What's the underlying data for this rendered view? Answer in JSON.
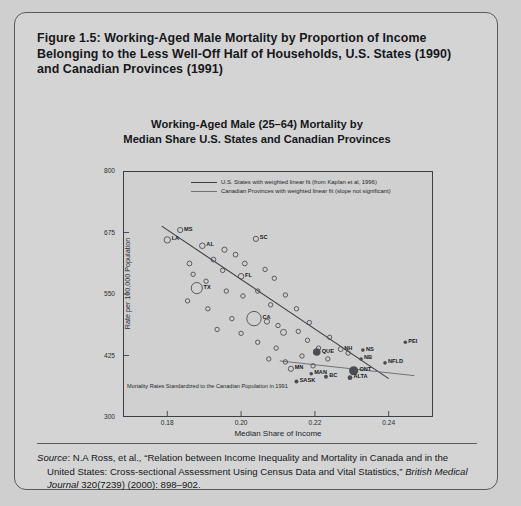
{
  "figure": {
    "caption": "Figure 1.5: Working-Aged Male Mortality by Proportion of Income Belonging to the Less Well-Off Half of Households, U.S. States (1990) and Canadian Provinces (1991)"
  },
  "source": {
    "label": "Source",
    "sep": ": ",
    "part1": "N.A Ross, et al., “Relation between Income Inequality and Mortality in Canada and in the United States: Cross-sectional Assessment Using Census Data and Vital Statistics,” ",
    "journal": "British Medical Journal",
    "part2": " 320(7239) (2000): 898–902."
  },
  "chart_data": {
    "type": "scatter",
    "title": "Working-Aged Male (25–64) Mortality by Median Share U.S. States and Canadian Provinces",
    "title_line1": "Working-Aged Male (25–64) Mortality by",
    "title_line2": "Median Share U.S. States and Canadian Provinces",
    "xlabel": "Median Share of Income",
    "ylabel": "Rate per 100,000 Population",
    "xlim": [
      0.168,
      0.252
    ],
    "ylim": [
      300,
      800
    ],
    "xticks": [
      "0.18",
      "0.20",
      "0.22",
      "0.24"
    ],
    "xtick_values": [
      0.18,
      0.2,
      0.22,
      0.24
    ],
    "yticks": [
      "300",
      "425",
      "550",
      "675",
      "800"
    ],
    "ytick_values": [
      300,
      425,
      550,
      675,
      800
    ],
    "grid": false,
    "note": "Mortality Rates Standardized to the Canadian Population in 1991",
    "legend_position": "top-center-inside",
    "legend": [
      {
        "name": "us-fit",
        "label": "U.S. States with weighted linear fit (from Kaplan et al, 1996)",
        "color": "#3a3d42"
      },
      {
        "name": "canada-fit",
        "label": "Canadian Provinces with weighted linear fit (slope not significant)",
        "color": "#6f7378"
      }
    ],
    "series": [
      {
        "name": "U.S. States",
        "marker": "open-circle",
        "color": "#4a4d52",
        "points": [
          {
            "label": "LA",
            "x": 0.18,
            "y": 660,
            "r": 3.2
          },
          {
            "label": "MS",
            "x": 0.1835,
            "y": 680,
            "r": 2.6
          },
          {
            "label": "AL",
            "x": 0.1895,
            "y": 648,
            "r": 2.8
          },
          {
            "label": "SC",
            "x": 0.204,
            "y": 662,
            "r": 2.6
          },
          {
            "label": "FL",
            "x": 0.2,
            "y": 586,
            "r": 2.8
          },
          {
            "label": "TX",
            "x": 0.188,
            "y": 562,
            "r": 5.6
          },
          {
            "label": "CA",
            "x": 0.2035,
            "y": 500,
            "r": 7.2
          },
          {
            "label": "NH",
            "x": 0.227,
            "y": 438,
            "r": 2.4
          },
          {
            "label": "MN",
            "x": 0.2135,
            "y": 398,
            "r": 2.6
          },
          {
            "label": "",
            "x": 0.186,
            "y": 612,
            "r": 2.4
          },
          {
            "label": "",
            "x": 0.1925,
            "y": 620,
            "r": 2.4
          },
          {
            "label": "",
            "x": 0.1955,
            "y": 640,
            "r": 2.6
          },
          {
            "label": "",
            "x": 0.1985,
            "y": 630,
            "r": 2.4
          },
          {
            "label": "",
            "x": 0.195,
            "y": 598,
            "r": 2.2
          },
          {
            "label": "",
            "x": 0.1905,
            "y": 576,
            "r": 2.2
          },
          {
            "label": "",
            "x": 0.187,
            "y": 590,
            "r": 2.2
          },
          {
            "label": "",
            "x": 0.201,
            "y": 612,
            "r": 2.4
          },
          {
            "label": "",
            "x": 0.2065,
            "y": 600,
            "r": 2.2
          },
          {
            "label": "",
            "x": 0.209,
            "y": 582,
            "r": 2.2
          },
          {
            "label": "",
            "x": 0.196,
            "y": 556,
            "r": 2.2
          },
          {
            "label": "",
            "x": 0.2005,
            "y": 546,
            "r": 2.2
          },
          {
            "label": "",
            "x": 0.2045,
            "y": 556,
            "r": 2.2
          },
          {
            "label": "",
            "x": 0.1855,
            "y": 536,
            "r": 2.2
          },
          {
            "label": "",
            "x": 0.191,
            "y": 520,
            "r": 2.2
          },
          {
            "label": "",
            "x": 0.208,
            "y": 528,
            "r": 2.2
          },
          {
            "label": "",
            "x": 0.212,
            "y": 548,
            "r": 2.2
          },
          {
            "label": "",
            "x": 0.215,
            "y": 520,
            "r": 2.2
          },
          {
            "label": "",
            "x": 0.1975,
            "y": 500,
            "r": 2.2
          },
          {
            "label": "",
            "x": 0.207,
            "y": 494,
            "r": 2.6
          },
          {
            "label": "",
            "x": 0.21,
            "y": 486,
            "r": 2.2
          },
          {
            "label": "",
            "x": 0.2115,
            "y": 472,
            "r": 3.0
          },
          {
            "label": "",
            "x": 0.1935,
            "y": 478,
            "r": 2.2
          },
          {
            "label": "",
            "x": 0.2,
            "y": 470,
            "r": 2.2
          },
          {
            "label": "",
            "x": 0.2155,
            "y": 474,
            "r": 2.2
          },
          {
            "label": "",
            "x": 0.2185,
            "y": 492,
            "r": 2.2
          },
          {
            "label": "",
            "x": 0.218,
            "y": 456,
            "r": 2.2
          },
          {
            "label": "",
            "x": 0.2045,
            "y": 452,
            "r": 2.2
          },
          {
            "label": "",
            "x": 0.2095,
            "y": 440,
            "r": 2.2
          },
          {
            "label": "",
            "x": 0.221,
            "y": 440,
            "r": 2.2
          },
          {
            "label": "",
            "x": 0.224,
            "y": 462,
            "r": 2.2
          },
          {
            "label": "",
            "x": 0.2165,
            "y": 424,
            "r": 2.2
          },
          {
            "label": "",
            "x": 0.2235,
            "y": 418,
            "r": 2.2
          },
          {
            "label": "",
            "x": 0.229,
            "y": 430,
            "r": 2.2
          },
          {
            "label": "",
            "x": 0.212,
            "y": 412,
            "r": 2.2
          },
          {
            "label": "",
            "x": 0.2195,
            "y": 404,
            "r": 2.2
          },
          {
            "label": "",
            "x": 0.2075,
            "y": 418,
            "r": 2.2
          }
        ]
      },
      {
        "name": "Canadian Provinces",
        "marker": "filled-circle",
        "color": "#4a4d52",
        "points": [
          {
            "label": "QUE",
            "x": 0.2205,
            "y": 432,
            "r": 3.8
          },
          {
            "label": "ONT",
            "x": 0.2305,
            "y": 394,
            "r": 4.6
          },
          {
            "label": "ALTA",
            "x": 0.2295,
            "y": 380,
            "r": 2.4
          },
          {
            "label": "BC",
            "x": 0.223,
            "y": 382,
            "r": 2.0
          },
          {
            "label": "MAN",
            "x": 0.219,
            "y": 388,
            "r": 1.8
          },
          {
            "label": "SASK",
            "x": 0.215,
            "y": 372,
            "r": 2.0
          },
          {
            "label": "NS",
            "x": 0.233,
            "y": 436,
            "r": 1.8
          },
          {
            "label": "NB",
            "x": 0.2325,
            "y": 418,
            "r": 1.8
          },
          {
            "label": "NFLD",
            "x": 0.239,
            "y": 410,
            "r": 1.8
          },
          {
            "label": "PEI",
            "x": 0.2445,
            "y": 452,
            "r": 1.8
          }
        ]
      }
    ],
    "fits": [
      {
        "name": "us-fit",
        "x0": 0.1785,
        "y0": 688,
        "x1": 0.24,
        "y1": 378,
        "color": "#3a3d42",
        "width": 1.1
      },
      {
        "name": "canada-fit",
        "x0": 0.2105,
        "y0": 414,
        "x1": 0.247,
        "y1": 384,
        "color": "#6f7378",
        "width": 1.0
      }
    ]
  }
}
